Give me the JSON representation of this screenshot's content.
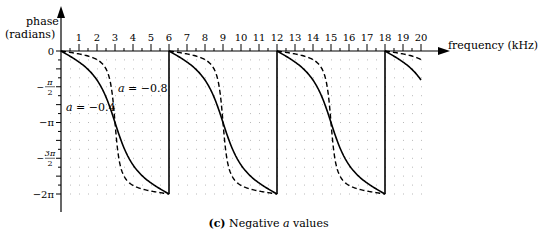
{
  "chart_data": {
    "type": "line",
    "title": "",
    "caption": {
      "prefix": "(c)",
      "text_before": "Negative",
      "italic": "a",
      "text_after": "values"
    },
    "ylabel_line1": "phase",
    "ylabel_line2": "(radians)",
    "xlabel": "frequency (kHz)",
    "xlim": [
      0,
      20
    ],
    "ylim_radians": [
      -6.2832,
      0
    ],
    "x_ticks": [
      1,
      2,
      3,
      4,
      5,
      6,
      7,
      8,
      9,
      10,
      11,
      12,
      13,
      14,
      15,
      16,
      17,
      18,
      19,
      20
    ],
    "y_ticks": [
      {
        "value": 0,
        "label": "0"
      },
      {
        "value": -1.5708,
        "label": "−π/2"
      },
      {
        "value": -3.1416,
        "label": "−π"
      },
      {
        "value": -4.7124,
        "label": "−3π/2"
      },
      {
        "value": -6.2832,
        "label": "−2π"
      }
    ],
    "grid": "dotted (0.5 kHz × π/8)",
    "wrap_period_khz": 6,
    "series": [
      {
        "name": "a = −0.4",
        "a": -0.4,
        "style": "solid",
        "x": [
          0,
          1,
          2,
          3,
          4,
          5,
          6
        ],
        "values": [
          0,
          -0.59,
          -1.57,
          -3.14,
          -4.71,
          -5.69,
          -6.28
        ]
      },
      {
        "name": "a = −0.8",
        "a": -0.8,
        "style": "dashed",
        "x": [
          0,
          1,
          2,
          3,
          4,
          5,
          6
        ],
        "values": [
          0,
          -0.24,
          -0.72,
          -3.14,
          -5.56,
          -6.04,
          -6.28
        ]
      }
    ],
    "annotations": [
      {
        "text_var": "a",
        "text_rest": " = −0.8",
        "x_khz": 3.2,
        "y": -2.0
      },
      {
        "text_var": "a",
        "text_rest": " = −0.4",
        "x_khz": 0.2,
        "y": -3.0
      }
    ]
  }
}
